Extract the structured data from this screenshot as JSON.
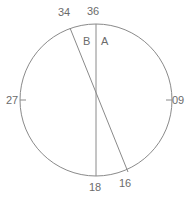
{
  "figure": {
    "background_color": "#ffffff",
    "stroke_color": "#8a8a8a",
    "text_color": "#6b6b6b",
    "circle": {
      "cx": 96,
      "cy": 100,
      "r": 76
    },
    "tick_labels": [
      {
        "id": "tick-36",
        "text": "36",
        "x": 87,
        "y": 5,
        "anchor": "top"
      },
      {
        "id": "tick-34",
        "text": "34",
        "x": 58,
        "y": 6,
        "anchor": "top-left"
      },
      {
        "id": "tick-27",
        "text": "27",
        "x": 6,
        "y": 94,
        "anchor": "left"
      },
      {
        "id": "tick-09",
        "text": "09",
        "x": 172,
        "y": 94,
        "anchor": "right"
      },
      {
        "id": "tick-18",
        "text": "18",
        "x": 89,
        "y": 181,
        "anchor": "bottom"
      },
      {
        "id": "tick-16",
        "text": "16",
        "x": 119,
        "y": 177,
        "anchor": "bottom-right"
      }
    ],
    "line_labels": [
      {
        "id": "label-B",
        "text": "B",
        "x": 83,
        "y": 35
      },
      {
        "id": "label-A",
        "text": "A",
        "x": 101,
        "y": 35
      }
    ],
    "lines": [
      {
        "id": "line-A",
        "label": "A",
        "x1": 96,
        "y1": 24,
        "x2": 96,
        "y2": 176
      },
      {
        "id": "line-B",
        "label": "B",
        "x1": 70,
        "y1": 28,
        "x2": 128,
        "y2": 172
      }
    ],
    "ticks": [
      {
        "id": "tick-mark-left",
        "x1": 20,
        "y1": 100,
        "x2": 26,
        "y2": 100
      },
      {
        "id": "tick-mark-right",
        "x1": 166,
        "y1": 100,
        "x2": 172,
        "y2": 100
      }
    ]
  }
}
